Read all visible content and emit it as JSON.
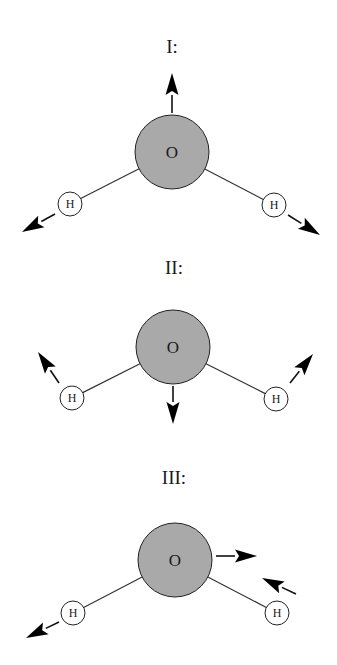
{
  "colors": {
    "oxygen_fill": "#a9a9a9",
    "hydrogen_fill": "#ffffff",
    "stroke": "#222222",
    "arrow": "#000000"
  },
  "modes": [
    {
      "label": "I:",
      "label_pos": [
        172,
        53
      ],
      "oxygen": {
        "symbol": "O",
        "cx": 172,
        "cy": 152,
        "r": 37
      },
      "hydrogens": [
        {
          "symbol": "H",
          "cx": 70,
          "cy": 204,
          "r": 12
        },
        {
          "symbol": "H",
          "cx": 274,
          "cy": 205,
          "r": 12
        }
      ],
      "arrows": [
        {
          "target": "oxygen",
          "from": [
            172,
            113
          ],
          "to": [
            172,
            73
          ]
        },
        {
          "target": "hydrogen-left",
          "from": [
            55,
            214
          ],
          "to": [
            22,
            232
          ]
        },
        {
          "target": "hydrogen-right",
          "from": [
            288,
            215
          ],
          "to": [
            320,
            235
          ]
        }
      ]
    },
    {
      "label": "II:",
      "label_pos": [
        174,
        274
      ],
      "oxygen": {
        "symbol": "O",
        "cx": 173,
        "cy": 347,
        "r": 37
      },
      "hydrogens": [
        {
          "symbol": "H",
          "cx": 72,
          "cy": 398,
          "r": 12
        },
        {
          "symbol": "H",
          "cx": 276,
          "cy": 399,
          "r": 12
        }
      ],
      "arrows": [
        {
          "target": "oxygen",
          "from": [
            173,
            386
          ],
          "to": [
            173,
            424
          ]
        },
        {
          "target": "hydrogen-left",
          "from": [
            59,
            383
          ],
          "to": [
            38,
            352
          ]
        },
        {
          "target": "hydrogen-right",
          "from": [
            290,
            383
          ],
          "to": [
            313,
            354
          ]
        }
      ]
    },
    {
      "label": "III:",
      "label_pos": [
        174,
        484
      ],
      "oxygen": {
        "symbol": "O",
        "cx": 175,
        "cy": 560,
        "r": 37
      },
      "hydrogens": [
        {
          "symbol": "H",
          "cx": 73,
          "cy": 613,
          "r": 12
        },
        {
          "symbol": "H",
          "cx": 277,
          "cy": 613,
          "r": 12
        }
      ],
      "arrows": [
        {
          "target": "oxygen",
          "from": [
            216,
            556
          ],
          "to": [
            257,
            556
          ]
        },
        {
          "target": "hydrogen-left",
          "from": [
            59,
            622
          ],
          "to": [
            26,
            638
          ]
        },
        {
          "target": "hydrogen-right",
          "from": [
            296,
            594
          ],
          "to": [
            262,
            578
          ]
        }
      ]
    }
  ]
}
